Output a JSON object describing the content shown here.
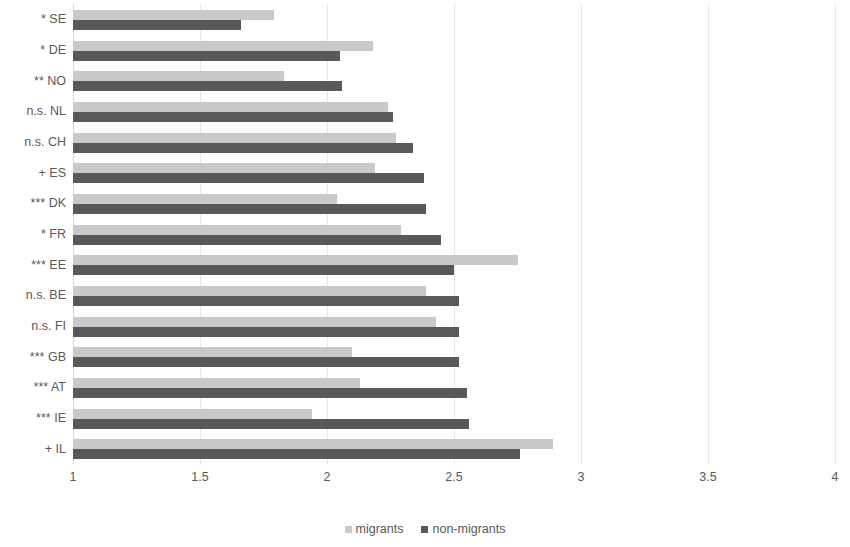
{
  "chart_data": {
    "type": "bar",
    "orientation": "horizontal",
    "title": "",
    "xlabel": "",
    "ylabel": "",
    "xlim": [
      1,
      4
    ],
    "xticks": [
      "1",
      "1.5",
      "2",
      "2.5",
      "3",
      "3.5",
      "4"
    ],
    "xtick_values": [
      1,
      1.5,
      2,
      2.5,
      3,
      3.5,
      4
    ],
    "grid": true,
    "grid_axis": "x",
    "legend_position": "bottom",
    "categories": [
      "* SE",
      "* DE",
      "** NO",
      "n.s. NL",
      "n.s. CH",
      "+ ES",
      "*** DK",
      "* FR",
      "*** EE",
      "n.s. BE",
      "n.s. FI",
      "*** GB",
      "*** AT",
      "*** IE",
      "+ IL"
    ],
    "series": [
      {
        "name": "migrants",
        "color": "#c9c9c9",
        "values": [
          1.79,
          2.18,
          1.83,
          2.24,
          2.27,
          2.19,
          2.04,
          2.29,
          2.75,
          2.39,
          2.43,
          2.1,
          2.13,
          1.94,
          2.89
        ]
      },
      {
        "name": "non-migrants",
        "color": "#595959",
        "values": [
          1.66,
          2.05,
          2.06,
          2.26,
          2.34,
          2.38,
          2.39,
          2.45,
          2.5,
          2.52,
          2.52,
          2.52,
          2.55,
          2.56,
          2.76
        ]
      }
    ]
  },
  "legend": {
    "items": [
      {
        "label": "migrants",
        "key": "migrants"
      },
      {
        "label": "non-migrants",
        "key": "non-migrants"
      }
    ]
  }
}
